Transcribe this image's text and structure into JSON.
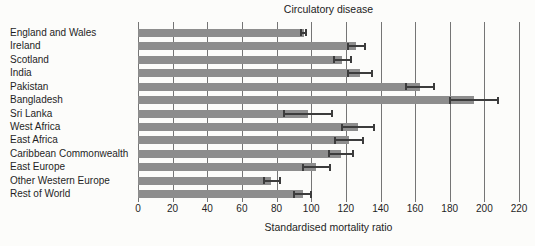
{
  "chart_data": {
    "type": "bar",
    "orientation": "horizontal",
    "title": "Circulatory disease",
    "xlabel": "Standardised mortality ratio",
    "xlim": [
      0,
      220
    ],
    "xticks": [
      0,
      20,
      40,
      60,
      80,
      100,
      120,
      140,
      160,
      180,
      200,
      220
    ],
    "grid": true,
    "legend": "none",
    "bar_color": "#8d8d8d",
    "error_color": "#3c3c3c",
    "grid_color": "#757575",
    "categories": [
      "England and Wales",
      "Ireland",
      "Scotland",
      "India",
      "Pakistan",
      "Bangladesh",
      "Sri Lanka",
      "West Africa",
      "East Africa",
      "Caribbean Commonwealth",
      "East Europe",
      "Other Western Europe",
      "Rest of World"
    ],
    "values": [
      96,
      126,
      118,
      128,
      163,
      194,
      98,
      127,
      122,
      117,
      103,
      77,
      95
    ],
    "error_low": [
      94,
      121,
      113,
      121,
      155,
      180,
      84,
      118,
      114,
      110,
      95,
      73,
      90
    ],
    "error_high": [
      97,
      131,
      123,
      135,
      171,
      208,
      112,
      136,
      130,
      124,
      111,
      82,
      100
    ]
  }
}
